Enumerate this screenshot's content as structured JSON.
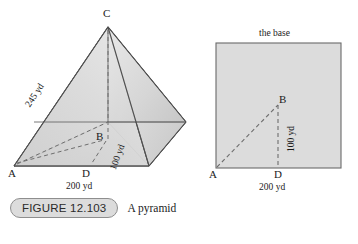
{
  "figure": {
    "number_label": "FIGURE 12.103",
    "caption": "A pyramid"
  },
  "pyramid": {
    "apex_label": "C",
    "center_label": "B",
    "foot_label": "D",
    "corner_label": "A",
    "slant_edge_length": "245 yd",
    "apothem_length": "100 yd",
    "base_edge_length": "200 yd"
  },
  "base_square": {
    "title": "the base",
    "corner_label": "A",
    "center_label": "B",
    "midpoint_label": "D",
    "half_edge_length": "100 yd",
    "edge_length": "200 yd"
  },
  "colors": {
    "face_light": "#e4e4e4",
    "face_mid": "#d2d2d2",
    "face_dark": "#c3c3c3",
    "base_fill": "#dcdcdc",
    "outline": "#5a5a5a",
    "dashed": "#6e6e6e",
    "pill_fill": "#dcdcdc",
    "pill_border": "#8e8e8e"
  }
}
